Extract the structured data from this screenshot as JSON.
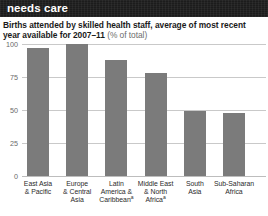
{
  "header": {
    "title": "needs care"
  },
  "chart_title": {
    "main": "Births attended by skilled health staff, average of most recent year available for 2007–11 ",
    "unit": "(% of total)"
  },
  "chart_data": {
    "type": "bar",
    "title": "Births attended by skilled health staff, average of most recent year available for 2007–11 (% of total)",
    "xlabel": "",
    "ylabel": "% of total",
    "ylim": [
      0,
      100
    ],
    "yticks": [
      "0",
      "25",
      "50",
      "75",
      "100"
    ],
    "ytick_values": [
      0,
      25,
      50,
      75,
      100
    ],
    "grid": true,
    "legend": "none",
    "categories": [
      "East Asia & Pacific",
      "Europe & Central Asia",
      "Latin America & Caribbeanᵃ",
      "Middle East & North Africaᵃ",
      "South Asia",
      "Sub-Saharan Africa"
    ],
    "category_lines": [
      [
        "East Asia",
        "& Pacific"
      ],
      [
        "Europe",
        "& Central",
        "Asia"
      ],
      [
        "Latin",
        "America &",
        "Caribbeanᵃ"
      ],
      [
        "Middle East",
        "& North",
        "Africaᵃ"
      ],
      [
        "South",
        "Asia"
      ],
      [
        "Sub-Saharan",
        "Africa"
      ]
    ],
    "values": [
      97,
      100,
      88,
      78,
      49,
      48
    ],
    "bar_color": "#7b7b7b",
    "gridline_color": "#c9c9c9"
  }
}
